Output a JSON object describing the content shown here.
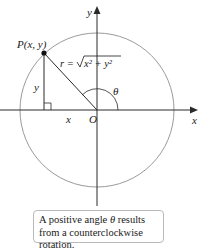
{
  "diagram": {
    "type": "polar-coordinates",
    "labels": {
      "y_axis": "y",
      "x_axis": "x",
      "origin": "O",
      "point": "P(x, y)",
      "radius_eq": "r = √x² + y²",
      "radius_r": "r =",
      "radius_expr": "x² + y²",
      "vertical_leg": "y",
      "horizontal_leg": "x",
      "angle": "θ"
    },
    "caption": {
      "part1": "A positive angle ",
      "theta": "θ",
      "part2": " results from a counterclockwise rotation."
    },
    "colors": {
      "circle": "#9a9a9a",
      "axes": "#2a2a2a",
      "text": "#1a1a1a",
      "box_border": "#b9b9b9"
    }
  }
}
